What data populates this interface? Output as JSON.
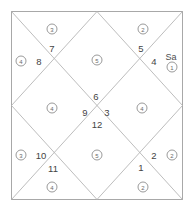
{
  "chart": {
    "type": "vedic-north-indian-kundali",
    "frame": {
      "x": 11,
      "y": 11,
      "width": 172,
      "height": 189,
      "line_color": "#b0b0b0",
      "border_color": "#a8a8a8"
    },
    "houses": [
      {
        "number": "1",
        "x": 141,
        "y": 167
      },
      {
        "number": "2",
        "x": 154,
        "y": 155
      },
      {
        "number": "3",
        "x": 107,
        "y": 112
      },
      {
        "number": "4",
        "x": 154,
        "y": 61
      },
      {
        "number": "5",
        "x": 141,
        "y": 48
      },
      {
        "number": "6",
        "x": 96,
        "y": 96
      },
      {
        "number": "7",
        "x": 52,
        "y": 48
      },
      {
        "number": "8",
        "x": 39,
        "y": 61
      },
      {
        "number": "9",
        "x": 85,
        "y": 112
      },
      {
        "number": "10",
        "x": 41,
        "y": 155
      },
      {
        "number": "11",
        "x": 53,
        "y": 168
      },
      {
        "number": "12",
        "x": 97,
        "y": 124
      }
    ],
    "signs": [
      {
        "number": "3",
        "x": 52,
        "y": 29
      },
      {
        "number": "2",
        "x": 143,
        "y": 29
      },
      {
        "number": "1",
        "x": 172,
        "y": 67
      },
      {
        "number": "4",
        "x": 21,
        "y": 61
      },
      {
        "number": "5",
        "x": 97,
        "y": 60
      },
      {
        "number": "4",
        "x": 52,
        "y": 108
      },
      {
        "number": "4",
        "x": 142,
        "y": 108
      },
      {
        "number": "3",
        "x": 21,
        "y": 155
      },
      {
        "number": "5",
        "x": 97,
        "y": 155
      },
      {
        "number": "2",
        "x": 172,
        "y": 155
      },
      {
        "number": "4",
        "x": 52,
        "y": 187
      },
      {
        "number": "2",
        "x": 143,
        "y": 187
      }
    ],
    "planets": [
      {
        "label": "Sa",
        "name": "saturn",
        "x": 171,
        "y": 57
      }
    ]
  }
}
